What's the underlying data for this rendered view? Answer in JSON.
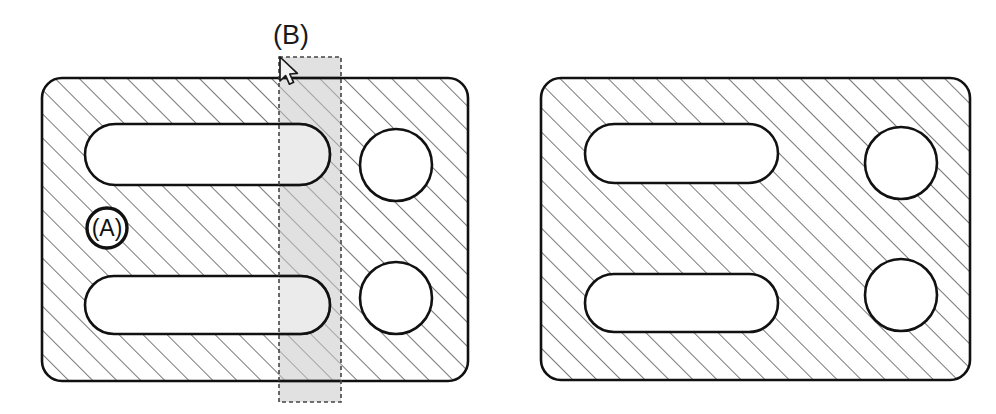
{
  "figure": {
    "type": "engineering-section-drawing",
    "background_color": "#ffffff",
    "line_color": "#111111",
    "hatch_color": "#555555",
    "selection_fill": "#d9d9d9",
    "selection_stroke": "#555555"
  },
  "annotations": {
    "section_label": "(B)",
    "callout_label": "(A)"
  },
  "cursor": {
    "icon": "mouse-pointer-icon",
    "tip_x": 280,
    "tip_y": 57
  },
  "left_view": {
    "name": "left-plate-section",
    "plate": {
      "x": 42,
      "y": 78,
      "width": 426,
      "height": 303,
      "radius": 20
    },
    "slots": [
      {
        "name": "upper-slot",
        "x": 85,
        "y": 124,
        "width": 245,
        "height": 61
      },
      {
        "name": "lower-slot",
        "x": 85,
        "y": 276,
        "width": 245,
        "height": 58
      }
    ],
    "holes": [
      {
        "name": "upper-hole",
        "cx": 396,
        "cy": 165,
        "r": 36
      },
      {
        "name": "lower-hole",
        "cx": 396,
        "cy": 298,
        "r": 36
      }
    ],
    "callout_circle": {
      "cx": 107,
      "cy": 228,
      "r": 20
    },
    "selection_band": {
      "x": 279,
      "y": 57,
      "width": 62,
      "height": 345
    }
  },
  "right_view": {
    "name": "right-plate-section",
    "plate": {
      "x": 541,
      "y": 78,
      "width": 429,
      "height": 302,
      "radius": 20
    },
    "slots": [
      {
        "name": "upper-slot",
        "x": 585,
        "y": 124,
        "width": 193,
        "height": 59
      },
      {
        "name": "lower-slot",
        "x": 585,
        "y": 274,
        "width": 193,
        "height": 58
      }
    ],
    "holes": [
      {
        "name": "upper-hole",
        "cx": 901,
        "cy": 163,
        "r": 36
      },
      {
        "name": "lower-hole",
        "cx": 901,
        "cy": 295,
        "r": 36
      }
    ]
  }
}
